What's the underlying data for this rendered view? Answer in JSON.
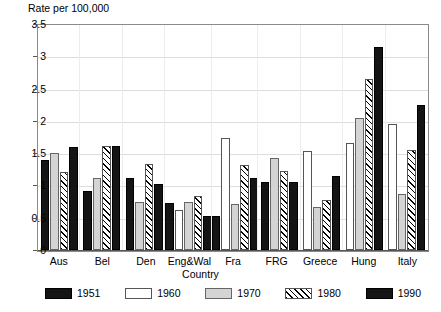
{
  "chart_data": {
    "type": "bar",
    "title": "",
    "ylabel": "Rate per 100,000",
    "xlabel": "Country",
    "ylim": [
      0,
      3.5
    ],
    "ytick_labels": [
      "3.5",
      "3",
      "2.5",
      "2",
      "1.5",
      "1",
      "0.5",
      "0"
    ],
    "ytick_values": [
      3.5,
      3,
      2.5,
      2,
      1.5,
      1,
      0.5,
      0
    ],
    "grid": true,
    "legend_position": "bottom",
    "categories": [
      "Aus",
      "Bel",
      "Den",
      "Eng&Wal",
      "Fra",
      "FRG",
      "Greece",
      "Hung",
      "Italy"
    ],
    "series": [
      {
        "name": "1951",
        "values": [
          1.4,
          0.91,
          1.12,
          0.73,
          0.53,
          1.06,
          null,
          null,
          null
        ]
      },
      {
        "name": "1960",
        "values": [
          null,
          null,
          null,
          0.62,
          1.73,
          null,
          1.53,
          1.66,
          1.95
        ]
      },
      {
        "name": "1970",
        "values": [
          1.5,
          1.11,
          0.74,
          0.74,
          0.72,
          1.43,
          0.67,
          2.04,
          0.87
        ]
      },
      {
        "name": "1980",
        "values": [
          1.21,
          1.61,
          1.33,
          0.83,
          1.32,
          1.23,
          0.78,
          2.65,
          1.55
        ]
      },
      {
        "name": "1990",
        "values": [
          1.6,
          1.61,
          1.02,
          0.52,
          1.12,
          1.06,
          1.14,
          3.15,
          2.24
        ]
      }
    ],
    "series_styles": [
      "b1951",
      "b1960",
      "b1970",
      "b1980",
      "b1990"
    ]
  },
  "legend": {
    "items": [
      {
        "label": "1951",
        "swatch": "b1951"
      },
      {
        "label": "1960",
        "swatch": "b1960"
      },
      {
        "label": "1970",
        "swatch": "b1970"
      },
      {
        "label": "1980",
        "swatch": "b1980"
      },
      {
        "label": "1990",
        "swatch": "b1990"
      }
    ]
  }
}
